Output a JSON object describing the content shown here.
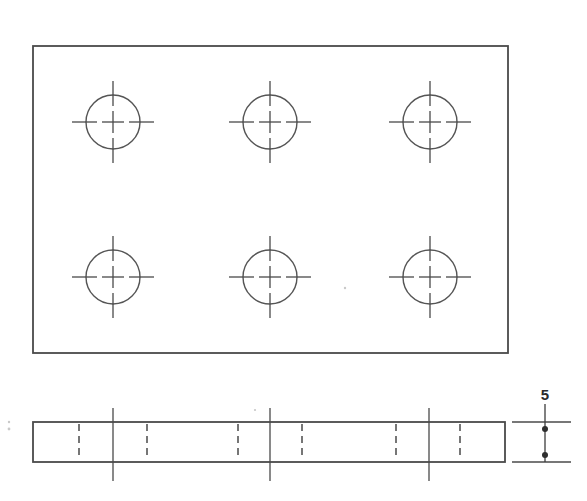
{
  "drawing": {
    "title": "Plate with six through holes — orthographic drawing",
    "units_note": "",
    "line_color": "#4a4a4a",
    "hidden_line_color": "#4a4a4a",
    "circle_color": "#555555",
    "dimension_color": "#2b2b2b",
    "background_color": "#ffffff"
  },
  "top_view": {
    "name": "top-view",
    "plate": {
      "x": 33,
      "y": 46,
      "width": 475,
      "height": 307
    },
    "hole_radius": 27,
    "centerline_outer_reach": 41,
    "centerline_inner_reach": 11,
    "centerline_gap_inner": 16,
    "holes": [
      {
        "label": "hole-1",
        "cx": 113,
        "cy": 122
      },
      {
        "label": "hole-2",
        "cx": 270,
        "cy": 122
      },
      {
        "label": "hole-3",
        "cx": 430,
        "cy": 122
      },
      {
        "label": "hole-4",
        "cx": 113,
        "cy": 277
      },
      {
        "label": "hole-5",
        "cx": 270,
        "cy": 277
      },
      {
        "label": "hole-6",
        "cx": 430,
        "cy": 277
      }
    ]
  },
  "front_view": {
    "name": "front-view",
    "plate": {
      "x": 33,
      "y": 422,
      "width": 472,
      "height": 40
    },
    "centerlines_x": [
      113,
      270,
      429
    ],
    "centerline_top_y": 408,
    "centerline_bottom_y": 481,
    "hidden_lines_x": [
      79,
      147,
      238,
      302,
      396,
      460
    ],
    "hidden_line_top_y": 424,
    "hidden_line_bottom_y": 460
  },
  "side_view": {
    "name": "side-view-thickness",
    "extension_lines": [
      {
        "x1": 512,
        "y1": 422,
        "x2": 571,
        "y2": 422
      },
      {
        "x1": 512,
        "y1": 462,
        "x2": 571,
        "y2": 462
      }
    ],
    "dimension_line": {
      "x": 545,
      "y1": 404,
      "y2": 462
    },
    "arrow_dots": [
      {
        "cx": 545,
        "cy": 429,
        "r": 3
      },
      {
        "cx": 545,
        "cy": 455,
        "r": 3
      }
    ]
  },
  "dimensions": [
    {
      "name": "thickness-dimension",
      "value": "5",
      "label": "5",
      "x": 545,
      "y": 400,
      "describes": "plate thickness"
    }
  ],
  "artifacts": [
    {
      "cx": 9,
      "cy": 429,
      "r": 1.4
    },
    {
      "cx": 9,
      "cy": 422,
      "r": 1.2
    },
    {
      "cx": 345,
      "cy": 288,
      "r": 1.2
    },
    {
      "cx": 255,
      "cy": 410,
      "r": 1.1
    }
  ]
}
